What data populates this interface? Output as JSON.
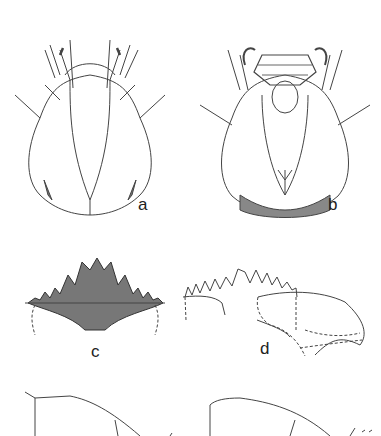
{
  "figure": {
    "panels": [
      {
        "id": "a",
        "label": "a",
        "description": "head capsule, dorsal view"
      },
      {
        "id": "b",
        "label": "b",
        "description": "head capsule, ventral view"
      },
      {
        "id": "c",
        "label": "c",
        "description": "mentum"
      },
      {
        "id": "d",
        "label": "d",
        "description": "mandible / mentum with ventromental plate"
      }
    ],
    "colors": {
      "ink": "#333333",
      "shade": "#666666",
      "background": "#ffffff"
    }
  }
}
